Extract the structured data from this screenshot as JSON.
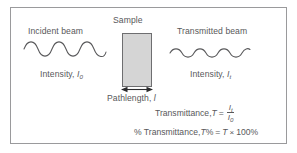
{
  "figure": {
    "frame_border_color": "#9a9a9c",
    "text_color": "#58585a",
    "sample_fill_color": "#d5d5d5",
    "sample_border_color": "#6e6e70"
  },
  "incident": {
    "heading": "Incident beam",
    "intensity_prefix": "Intensity, ",
    "intensity_symbol": "I",
    "intensity_subscript": "0"
  },
  "sample": {
    "heading": "Sample",
    "pathlength_prefix": "Pathlength, ",
    "pathlength_symbol": "l"
  },
  "transmitted": {
    "heading": "Transmitted beam",
    "intensity_prefix": "Intensity, ",
    "intensity_symbol": "I",
    "intensity_subscript": "t"
  },
  "formulas": {
    "transmittance": {
      "label": "Transmittance, ",
      "symbol": "T",
      "equals": "=",
      "numerator_symbol": "I",
      "numerator_subscript": "t",
      "denominator_symbol": "I",
      "denominator_subscript": "0"
    },
    "percent_transmittance": {
      "label": "% Transmittance, ",
      "symbol": "T",
      "percent": "%",
      "equals": "=",
      "right_symbol": "T",
      "times": "×",
      "value": "100%"
    }
  }
}
